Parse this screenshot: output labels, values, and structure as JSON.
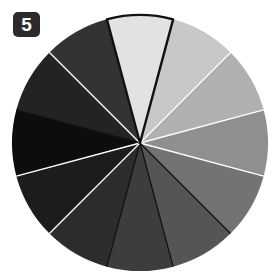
{
  "badge": {
    "label": "5",
    "background_color": "#2b2b2b",
    "text_color": "#ffffff"
  },
  "canvas": {
    "background_color": "#ffffff",
    "width": 275,
    "height": 275
  },
  "chart_data": {
    "type": "pie",
    "title": "",
    "subtitle": "",
    "xlabel": "",
    "ylabel": "",
    "grid": false,
    "legend": "none",
    "center_x": 140,
    "center_y": 143,
    "radius": 128,
    "start_angle_deg": -105,
    "slice_count": 12,
    "equal_slices": true,
    "slice_angle_deg": 30,
    "highlight_index": 0,
    "highlight_outline_color": "#111111",
    "highlight_outline_width": 2.4,
    "categories": [
      "1",
      "2",
      "3",
      "4",
      "5",
      "6",
      "7",
      "8",
      "9",
      "10",
      "11",
      "12"
    ],
    "values": [
      30,
      30,
      30,
      30,
      30,
      30,
      30,
      30,
      30,
      30,
      30,
      30
    ],
    "colors": [
      "#e2e2e2",
      "#c8c8c8",
      "#b0b0b0",
      "#8f8f8f",
      "#737373",
      "#555555",
      "#3d3d3d",
      "#2c2c2c",
      "#1c1c1c",
      "#0d0d0d",
      "#232323",
      "#333333"
    ],
    "separator_colors": [
      "#ffffff",
      "#ffffff",
      "#ffffff",
      "#ffffff",
      "#ffffff",
      "#111111",
      "#111111",
      "#111111",
      "#ffffff",
      "#ffffff",
      "#111111",
      "#ffffff"
    ],
    "separator_width": 1.3
  }
}
